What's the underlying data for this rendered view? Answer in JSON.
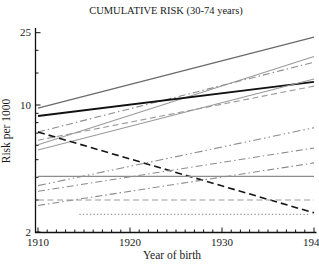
{
  "title": "CUMULATIVE RISK (30-74 years)",
  "chart_data": {
    "type": "line",
    "title": "CUMULATIVE RISK (30-74 years)",
    "xlabel": "Year of birth",
    "ylabel": "Risk per 1000",
    "x_range": [
      1910,
      1940
    ],
    "y_range": [
      2,
      25
    ],
    "y_scale": "log",
    "grid": false,
    "legend": "none",
    "x_tick_labels": [
      "1910",
      "1920",
      "1930",
      "1940"
    ],
    "x_ticks_major": [
      1910,
      1920,
      1930,
      1940
    ],
    "x_minor_tick_step_years": 1,
    "y_tick_labels": [
      "25",
      "10",
      "2"
    ],
    "y_ticks_labeled": [
      25,
      10,
      2
    ],
    "y_ticks_minor": [
      3,
      4,
      5,
      6,
      7,
      8,
      9,
      15,
      20
    ],
    "axis_color": "#111111",
    "series": [
      {
        "name": "upper-solid-steep",
        "style": "solid",
        "color": "#6a6a6a",
        "width": 1.3,
        "points": [
          [
            1910,
            9.6
          ],
          [
            1940,
            23.6
          ]
        ]
      },
      {
        "name": "upper-solid",
        "style": "solid",
        "color": "#9a9a9a",
        "width": 1.1,
        "points": [
          [
            1910,
            6.05
          ],
          [
            1940,
            18.5
          ]
        ]
      },
      {
        "name": "upper-dash-dot",
        "style": "dash-dot",
        "color": "#8c8c8c",
        "width": 1.1,
        "points": [
          [
            1910,
            7.1
          ],
          [
            1940,
            17.2
          ]
        ]
      },
      {
        "name": "bold-solid-black",
        "style": "solid",
        "color": "#111111",
        "width": 1.9,
        "points": [
          [
            1910,
            8.7
          ],
          [
            1940,
            13.4
          ]
        ]
      },
      {
        "name": "mid-solid",
        "style": "solid",
        "color": "#9a9a9a",
        "width": 1.1,
        "points": [
          [
            1910,
            5.65
          ],
          [
            1940,
            13.9
          ]
        ]
      },
      {
        "name": "mid-dashed",
        "style": "dashed",
        "color": "#9a9a9a",
        "width": 1.1,
        "points": [
          [
            1910,
            6.4
          ],
          [
            1940,
            12.7
          ]
        ]
      },
      {
        "name": "declining-dashed-black",
        "style": "long-dash",
        "color": "#151515",
        "width": 1.6,
        "points": [
          [
            1910,
            7.1
          ],
          [
            1940,
            2.55
          ]
        ]
      },
      {
        "name": "lower-dash-dot-dot",
        "style": "dash-dot-dot",
        "color": "#8c8c8c",
        "width": 1.1,
        "points": [
          [
            1910,
            3.6
          ],
          [
            1940,
            7.5
          ]
        ]
      },
      {
        "name": "lower-dash-dot-upper",
        "style": "dash-dot",
        "color": "#8c8c8c",
        "width": 1.1,
        "points": [
          [
            1910,
            3.35
          ],
          [
            1940,
            5.8
          ]
        ]
      },
      {
        "name": "lower-dash-dot-lower",
        "style": "dash-dot",
        "color": "#8c8c8c",
        "width": 1.1,
        "points": [
          [
            1910,
            2.8
          ],
          [
            1940,
            4.8
          ]
        ]
      },
      {
        "name": "flat-solid",
        "style": "solid",
        "color": "#8c8c8c",
        "width": 1.1,
        "points": [
          [
            1910,
            4.05
          ],
          [
            1940,
            4.05
          ]
        ]
      },
      {
        "name": "flat-dashed",
        "style": "dashed",
        "color": "#9a9a9a",
        "width": 1.1,
        "points": [
          [
            1910,
            3.0
          ],
          [
            1940,
            3.0
          ]
        ]
      },
      {
        "name": "flat-dotted",
        "style": "dotted",
        "color": "#9a9a9a",
        "width": 1.2,
        "points": [
          [
            1914.5,
            2.5
          ],
          [
            1939.5,
            2.5
          ]
        ]
      }
    ]
  }
}
